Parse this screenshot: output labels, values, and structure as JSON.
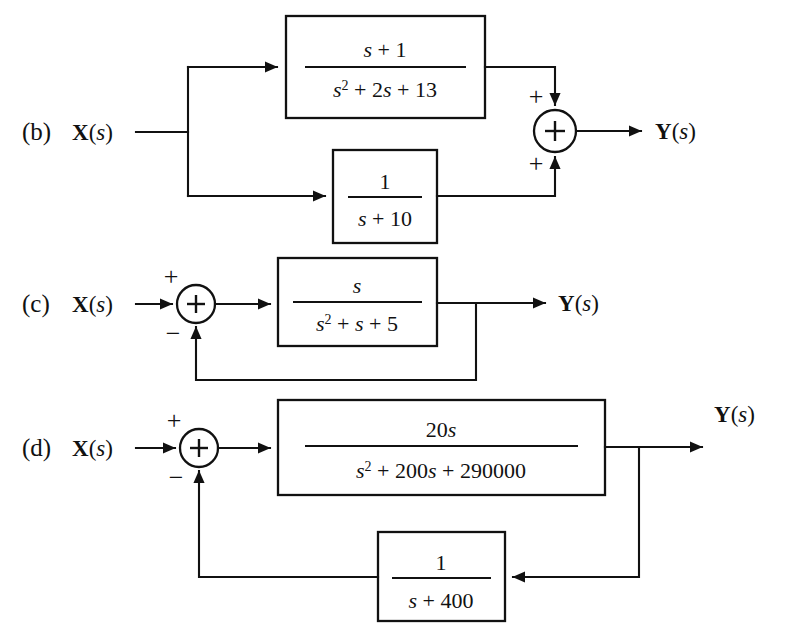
{
  "figure": {
    "kind": "control-system-block-diagram",
    "background_color": "#ffffff",
    "line_color": "#111111"
  },
  "parts": {
    "b": {
      "label": "(b)",
      "input_label_main": "X",
      "input_label_arg": "(s)",
      "output_label_main": "Y",
      "output_label_arg": "(s)",
      "blocks": {
        "forward_top": {
          "numerator_pre": "s",
          "numerator_op": " + ",
          "numerator_post": "1",
          "numerator_full": "s + 1",
          "denominator_full": "s2 + 2s + 13",
          "den_base": "s",
          "den_exp": "2",
          "den_rest": " + 2s + 13"
        },
        "forward_bottom": {
          "numerator_full": "1",
          "denominator_full": "s + 10",
          "den_base": "s",
          "den_exp": "",
          "den_rest": " + 10"
        }
      },
      "summing_junction": {
        "operator": "+",
        "top_sign": "+",
        "bottom_sign": "+"
      }
    },
    "c": {
      "label": "(c)",
      "input_label_main": "X",
      "input_label_arg": "(s)",
      "output_label_main": "Y",
      "output_label_arg": "(s)",
      "blocks": {
        "forward": {
          "numerator_full": "s",
          "denominator_full": "s2 + s + 5",
          "den_base": "s",
          "den_exp": "2",
          "den_rest": " + s + 5"
        }
      },
      "summing_junction": {
        "operator": "+",
        "top_sign": "+",
        "bottom_sign": "−"
      },
      "feedback": "unity"
    },
    "d": {
      "label": "(d)",
      "input_label_main": "X",
      "input_label_arg": "(s)",
      "output_label_main": "Y",
      "output_label_arg": "(s)",
      "blocks": {
        "forward": {
          "numerator_full": "20s",
          "num_coef": "20",
          "num_var": "s",
          "denominator_full": "s2 + 200s + 290000",
          "den_base": "s",
          "den_exp": "2",
          "den_rest": " + 200s + 290000"
        },
        "feedback": {
          "numerator_full": "1",
          "denominator_full": "s + 400",
          "den_base": "s",
          "den_exp": "",
          "den_rest": " + 400"
        }
      },
      "summing_junction": {
        "operator": "+",
        "top_sign": "+",
        "bottom_sign": "−"
      }
    }
  }
}
